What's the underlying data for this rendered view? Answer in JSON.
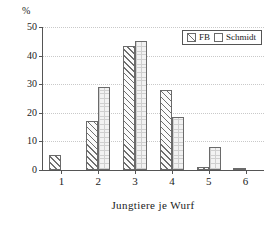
{
  "chart_data": {
    "type": "bar",
    "title": "",
    "xlabel": "Jungtiere je Wurf",
    "ylabel": "%",
    "categories": [
      "1",
      "2",
      "3",
      "4",
      "5",
      "6"
    ],
    "series": [
      {
        "name": "FB",
        "values": [
          5.2,
          17.0,
          43.5,
          28.0,
          1.0,
          0.7
        ]
      },
      {
        "name": "Schmidt",
        "values": [
          0,
          29.0,
          45.0,
          18.5,
          8.0,
          0
        ]
      }
    ],
    "ylim": [
      0,
      50
    ],
    "yticks": [
      0,
      10,
      20,
      30,
      40,
      50
    ],
    "ytick_labels": [
      "0",
      "10",
      "20",
      "30",
      "40",
      "50"
    ],
    "grid": true,
    "legend_position": "top-right"
  },
  "axes": {
    "y_unit_label": "%",
    "x_axis_title": "Jungtiere je Wurf"
  },
  "legend": {
    "entries": [
      {
        "label": "FB",
        "pattern": "diagonal-hatch"
      },
      {
        "label": "Schmidt",
        "pattern": "fine-grid"
      }
    ]
  }
}
